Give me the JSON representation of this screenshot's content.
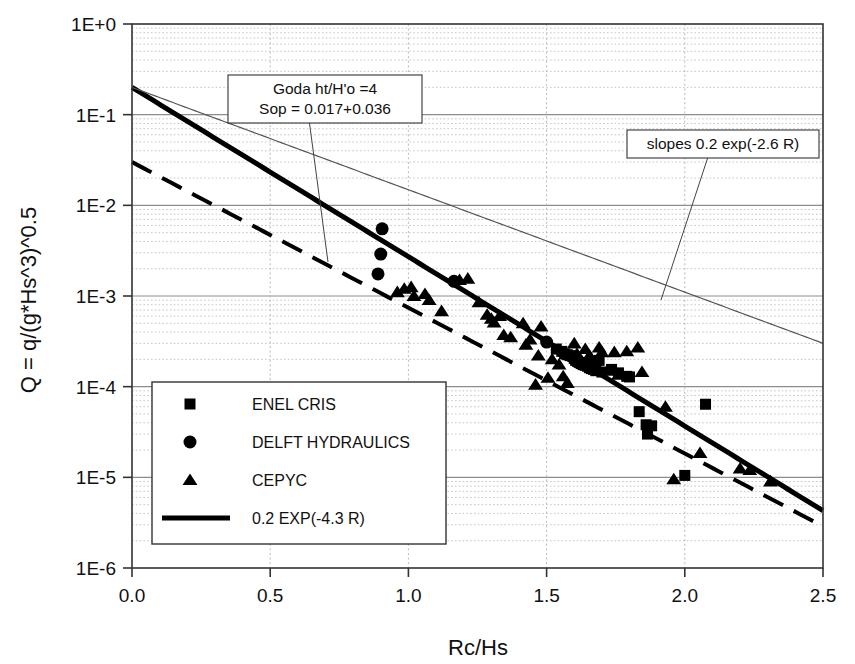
{
  "chart_data": {
    "type": "scatter",
    "title": "",
    "xlabel": "Rc/Hs",
    "ylabel": "Q = q/(g*Hs^3)^0.5",
    "xlim": [
      0.0,
      2.5
    ],
    "ylim": [
      1e-06,
      1.0
    ],
    "yscale": "log",
    "xscale": "linear",
    "grid": true,
    "grid_minor": true,
    "xticks": [
      "0.0",
      "0.5",
      "1.0",
      "1.5",
      "2.0",
      "2.5"
    ],
    "xtick_values": [
      0.0,
      0.5,
      1.0,
      1.5,
      2.0,
      2.5
    ],
    "yticks": [
      "1E+0",
      "1E-1",
      "1E-2",
      "1E-3",
      "1E-4",
      "1E-5",
      "1E-6"
    ],
    "ytick_values": [
      1,
      0.1,
      0.01,
      0.001,
      0.0001,
      1e-05,
      1e-06
    ],
    "legend_position": "lower-left",
    "series": [
      {
        "name": "ENEL CRIS",
        "marker": "square",
        "color": "#000000",
        "points": [
          [
            1.535,
            0.00026
          ],
          [
            1.555,
            0.000245
          ],
          [
            1.565,
            0.00023
          ],
          [
            1.575,
            0.000225
          ],
          [
            1.585,
            0.00022
          ],
          [
            1.595,
            0.000215
          ],
          [
            1.6,
            0.000205
          ],
          [
            1.605,
            0.000195
          ],
          [
            1.612,
            0.00019
          ],
          [
            1.618,
            0.000185
          ],
          [
            1.625,
            0.00018
          ],
          [
            1.632,
            0.000175
          ],
          [
            1.64,
            0.000172
          ],
          [
            1.648,
            0.000168
          ],
          [
            1.655,
            0.000162
          ],
          [
            1.662,
            0.000158
          ],
          [
            1.67,
            0.000155
          ],
          [
            1.678,
            0.00015
          ],
          [
            1.69,
            0.000195
          ],
          [
            1.7,
            0.000145
          ],
          [
            1.735,
            0.000155
          ],
          [
            1.76,
            0.000142
          ],
          [
            1.79,
            0.00013
          ],
          [
            1.8,
            0.000128
          ],
          [
            1.835,
            5.3e-05
          ],
          [
            1.86,
            3.8e-05
          ],
          [
            1.865,
            3e-05
          ],
          [
            1.88,
            3.7e-05
          ],
          [
            2.0,
            1.05e-05
          ],
          [
            2.075,
            6.4e-05
          ]
        ]
      },
      {
        "name": "DELFT HYDRAULICS",
        "marker": "circle",
        "color": "#000000",
        "points": [
          [
            0.905,
            0.0055
          ],
          [
            0.9,
            0.0029
          ],
          [
            0.89,
            0.00175
          ],
          [
            1.165,
            0.00145
          ],
          [
            1.5,
            0.00031
          ]
        ]
      },
      {
        "name": "CEPYC",
        "marker": "triangle",
        "color": "#000000",
        "points": [
          [
            0.96,
            0.0011
          ],
          [
            0.985,
            0.0012
          ],
          [
            1.01,
            0.00125
          ],
          [
            1.02,
            0.001
          ],
          [
            1.06,
            0.00105
          ],
          [
            1.075,
            0.0009
          ],
          [
            1.12,
            0.00068
          ],
          [
            1.215,
            0.00155
          ],
          [
            1.285,
            0.00062
          ],
          [
            1.3,
            0.00056
          ],
          [
            1.31,
            0.00051
          ],
          [
            1.33,
            0.0006
          ],
          [
            1.345,
            0.00037
          ],
          [
            1.37,
            0.00035
          ],
          [
            1.425,
            0.00029
          ],
          [
            1.44,
            0.00033
          ],
          [
            1.47,
            0.00022
          ],
          [
            1.48,
            0.00046
          ],
          [
            1.52,
            0.0002
          ],
          [
            1.545,
            0.000175
          ],
          [
            1.56,
            0.00013
          ],
          [
            1.575,
            0.00011
          ],
          [
            1.6,
            0.0003
          ],
          [
            1.61,
            0.00023
          ],
          [
            1.64,
            0.00026
          ],
          [
            1.655,
            0.00022
          ],
          [
            1.665,
            0.000195
          ],
          [
            1.69,
            0.00027
          ],
          [
            1.7,
            0.00024
          ],
          [
            1.72,
            0.00015
          ],
          [
            1.745,
            0.00024
          ],
          [
            1.76,
            0.000135
          ],
          [
            1.79,
            0.000245
          ],
          [
            1.83,
            0.00027
          ],
          [
            1.845,
            0.000145
          ],
          [
            1.93,
            6e-05
          ],
          [
            1.96,
            9.5e-06
          ],
          [
            2.055,
            1.85e-05
          ],
          [
            2.2,
            1.25e-05
          ],
          [
            2.235,
            1.2e-05
          ],
          [
            2.31,
            9e-06
          ],
          [
            1.185,
            0.0015
          ],
          [
            1.255,
            0.00085
          ],
          [
            1.415,
            0.0005
          ],
          [
            1.46,
            0.000105
          ],
          [
            1.505,
            0.000125
          ]
        ]
      }
    ],
    "lines": [
      {
        "name": "0.2 EXP(-4.3 R)",
        "style": "solid-thick",
        "equation": "Q = 0.2 exp(-4.3 R)",
        "coefficient": 0.2,
        "exponent": -4.3,
        "width": 5,
        "color": "#000000"
      },
      {
        "name": "slopes 0.2 exp(-2.6 R)",
        "style": "solid-thin",
        "equation": "Q = 0.2 exp(-2.6 R)",
        "coefficient": 0.2,
        "exponent": -2.6,
        "width": 1.2,
        "color": "#555555"
      },
      {
        "name": "Goda ht/H'o =4",
        "style": "dashed",
        "equation": "Q = 0.03 exp(-3.7 R)",
        "coefficient": 0.03,
        "exponent": -3.7,
        "width": 4,
        "color": "#000000"
      }
    ],
    "annotations": [
      {
        "name": "goda-annotation",
        "lines": [
          "Goda ht/H'o  =4",
          "Sop  =  0.017+0.036"
        ],
        "box_x": 228,
        "box_y": 75,
        "box_w": 194,
        "box_h": 48,
        "arrow_to_x": 328,
        "arrow_to_y": 262
      },
      {
        "name": "slopes-annotation",
        "lines": [
          "slopes 0.2 exp(-2.6 R)"
        ],
        "box_x": 627,
        "box_y": 130,
        "box_w": 192,
        "box_h": 28,
        "arrow_to_x": 661,
        "arrow_to_y": 300
      }
    ]
  },
  "legend": {
    "items": [
      {
        "label": "ENEL CRIS",
        "marker": "square"
      },
      {
        "label": "DELFT HYDRAULICS",
        "marker": "circle"
      },
      {
        "label": "CEPYC",
        "marker": "triangle"
      },
      {
        "label": "0.2 EXP(-4.3 R)",
        "marker": "line"
      }
    ]
  },
  "axes": {
    "x_title": "Rc/Hs",
    "y_title": "Q = q/(g*Hs^3)^0.5",
    "x_labels": [
      "0.0",
      "0.5",
      "1.0",
      "1.5",
      "2.0",
      "2.5"
    ],
    "y_labels": [
      "1E+0",
      "1E-1",
      "1E-2",
      "1E-3",
      "1E-4",
      "1E-5",
      "1E-6"
    ]
  },
  "annotation_text": {
    "goda_line1": "Goda ht/H'o  =4",
    "goda_line2": "Sop  =  0.017+0.036",
    "slopes": "slopes 0.2 exp(-2.6 R)"
  },
  "colors": {
    "axis": "#333333",
    "grid_major": "#8d8d8d",
    "grid_minor": "#b9b9b9",
    "marker": "#000000",
    "thin_line": "#555555"
  }
}
